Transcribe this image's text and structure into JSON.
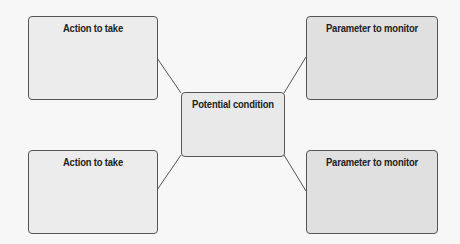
{
  "diagram": {
    "center": {
      "label": "Potential condition"
    },
    "top_left": {
      "label": "Action to take"
    },
    "bottom_left": {
      "label": "Action to take"
    },
    "top_right": {
      "label": "Parameter to monitor"
    },
    "bottom_right": {
      "label": "Parameter to monitor"
    },
    "colors": {
      "background": "#f7f7f7",
      "left_box_fill": "#ececec",
      "right_box_fill": "#e0e0e0",
      "center_box_fill": "#e9e9e9",
      "stroke": "#555555"
    }
  }
}
